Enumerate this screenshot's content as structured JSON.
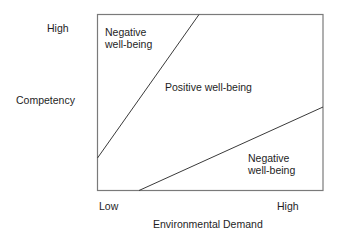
{
  "diagram": {
    "type": "competency-press-model",
    "y_axis": {
      "label": "Competency",
      "high_label": "High"
    },
    "x_axis": {
      "label": "Environmental Demand",
      "low_label": "Low",
      "high_label": "High"
    },
    "regions": {
      "upper_left": "Negative\nwell-being",
      "middle": "Positive well-being",
      "lower_right": "Negative\nwell-being"
    },
    "colors": {
      "frame": "#7a7a7a",
      "lines": "#3a3a3a",
      "text": "#1e1e1e"
    }
  }
}
